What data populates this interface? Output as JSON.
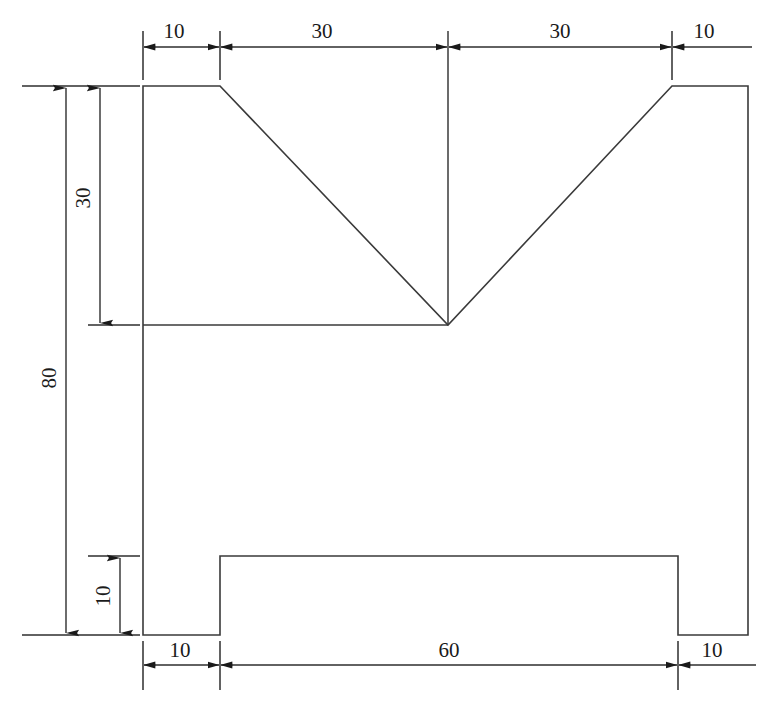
{
  "drawing": {
    "title": "V-block orthographic front view",
    "background_color": "#ffffff",
    "line_color": "#3a3a3a",
    "text_color": "#1a1a1a",
    "units_note": "",
    "dimensions": {
      "top_left_flat": "10",
      "top_left_slope_run": "30",
      "top_right_slope_run": "30",
      "top_right_flat": "10",
      "upper_height": "30",
      "overall_height": "80",
      "foot_height": "10",
      "bottom_left_foot": "10",
      "bottom_middle_span": "60",
      "bottom_right_foot": "10"
    }
  }
}
